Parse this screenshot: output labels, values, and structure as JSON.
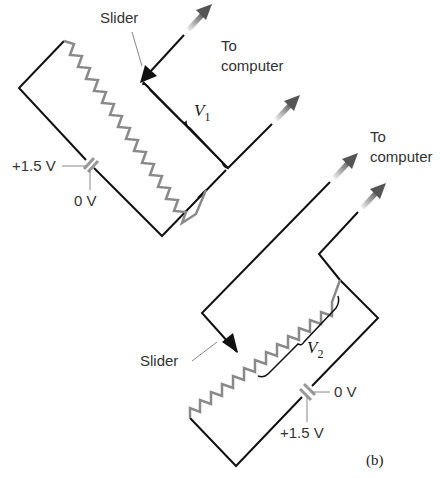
{
  "figure_label": "(b)",
  "colors": {
    "wire": "#111111",
    "resistor": "#8a8a8a",
    "leader": "#888888",
    "arrow_gradient_start": "#e6e6e6",
    "arrow_gradient_end": "#555555"
  },
  "upper_circuit": {
    "slider_label": "Slider",
    "output_label_line1": "To",
    "output_label_line2": "computer",
    "voltage_symbol": "V",
    "voltage_subscript": "1",
    "battery_positive_label": "+1.5 V",
    "battery_ground_label": "0 V"
  },
  "lower_circuit": {
    "slider_label": "Slider",
    "output_label_line1": "To",
    "output_label_line2": "computer",
    "voltage_symbol": "V",
    "voltage_subscript": "2",
    "battery_positive_label": "+1.5 V",
    "battery_ground_label": "0 V"
  }
}
